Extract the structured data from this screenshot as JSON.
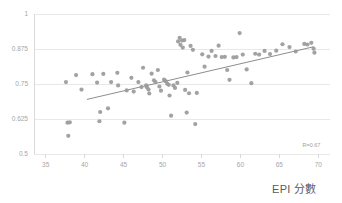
{
  "chart_data": {
    "type": "scatter",
    "title": "",
    "subtitle": "",
    "xlabel": "EPI 分數",
    "ylabel": "",
    "xlim": [
      33.5,
      71.5
    ],
    "ylim": [
      0.5,
      1.0
    ],
    "grid": true,
    "grid_axis": "y",
    "legend": "none",
    "annotations": [
      {
        "name": "correlation",
        "text": "R=0.67",
        "x": 69.0,
        "y": 0.527
      }
    ],
    "xticks": [
      35,
      40,
      45,
      50,
      55,
      60,
      65,
      70
    ],
    "xtick_labels": [
      "35",
      "40",
      "45",
      "50",
      "55",
      "60",
      "65",
      "70"
    ],
    "yticks": [
      0.5,
      0.625,
      0.75,
      0.875,
      1
    ],
    "ytick_labels": [
      "0.5",
      "0.625",
      "0.75",
      "0.875",
      "1"
    ],
    "point_color": "#9a9a9a",
    "point_radius": 2.1,
    "trendline": {
      "name": "linear-fit",
      "color": "#808080",
      "x_start": 40.3,
      "y_start": 0.695,
      "x_end": 69.4,
      "y_end": 0.883
    },
    "series": [
      {
        "name": "countries",
        "points": [
          [
            37.8,
            0.612
          ],
          [
            38.1,
            0.613
          ],
          [
            37.9,
            0.565
          ],
          [
            37.6,
            0.757
          ],
          [
            38.9,
            0.782
          ],
          [
            39.6,
            0.73
          ],
          [
            41.0,
            0.785
          ],
          [
            41.6,
            0.755
          ],
          [
            41.9,
            0.617
          ],
          [
            42.0,
            0.65
          ],
          [
            42.4,
            0.786
          ],
          [
            43.0,
            0.663
          ],
          [
            43.4,
            0.757
          ],
          [
            44.2,
            0.79
          ],
          [
            44.3,
            0.745
          ],
          [
            45.1,
            0.612
          ],
          [
            45.4,
            0.727
          ],
          [
            46.0,
            0.772
          ],
          [
            46.3,
            0.723
          ],
          [
            46.9,
            0.757
          ],
          [
            47.3,
            0.739
          ],
          [
            47.5,
            0.808
          ],
          [
            47.9,
            0.745
          ],
          [
            48.0,
            0.738
          ],
          [
            48.2,
            0.73
          ],
          [
            48.3,
            0.716
          ],
          [
            48.6,
            0.787
          ],
          [
            48.9,
            0.763
          ],
          [
            49.1,
            0.757
          ],
          [
            49.4,
            0.8
          ],
          [
            49.6,
            0.741
          ],
          [
            49.8,
            0.726
          ],
          [
            50.2,
            0.766
          ],
          [
            50.4,
            0.76
          ],
          [
            50.6,
            0.751
          ],
          [
            50.8,
            0.747
          ],
          [
            50.9,
            0.709
          ],
          [
            51.1,
            0.637
          ],
          [
            51.4,
            0.745
          ],
          [
            51.6,
            0.736
          ],
          [
            51.9,
            0.754
          ],
          [
            52.0,
            0.902
          ],
          [
            52.2,
            0.915
          ],
          [
            52.3,
            0.89
          ],
          [
            52.5,
            0.905
          ],
          [
            52.6,
            0.88
          ],
          [
            52.8,
            0.907
          ],
          [
            52.9,
            0.729
          ],
          [
            53.1,
            0.648
          ],
          [
            53.2,
            0.791
          ],
          [
            53.4,
            0.717
          ],
          [
            53.6,
            0.886
          ],
          [
            53.9,
            0.872
          ],
          [
            54.2,
            0.607
          ],
          [
            54.4,
            0.718
          ],
          [
            55.1,
            0.856
          ],
          [
            55.4,
            0.812
          ],
          [
            55.9,
            0.848
          ],
          [
            56.3,
            0.868
          ],
          [
            56.8,
            0.85
          ],
          [
            57.2,
            0.887
          ],
          [
            57.6,
            0.846
          ],
          [
            58.0,
            0.847
          ],
          [
            58.3,
            0.8
          ],
          [
            58.6,
            0.765
          ],
          [
            59.1,
            0.845
          ],
          [
            59.5,
            0.846
          ],
          [
            59.9,
            0.932
          ],
          [
            60.3,
            0.855
          ],
          [
            60.8,
            0.802
          ],
          [
            61.4,
            0.753
          ],
          [
            61.9,
            0.858
          ],
          [
            62.4,
            0.855
          ],
          [
            63.1,
            0.868
          ],
          [
            63.8,
            0.857
          ],
          [
            64.6,
            0.869
          ],
          [
            65.4,
            0.892
          ],
          [
            66.3,
            0.882
          ],
          [
            67.1,
            0.866
          ],
          [
            68.2,
            0.893
          ],
          [
            68.6,
            0.891
          ],
          [
            69.1,
            0.897
          ],
          [
            69.4,
            0.876
          ],
          [
            69.5,
            0.862
          ]
        ]
      }
    ]
  }
}
